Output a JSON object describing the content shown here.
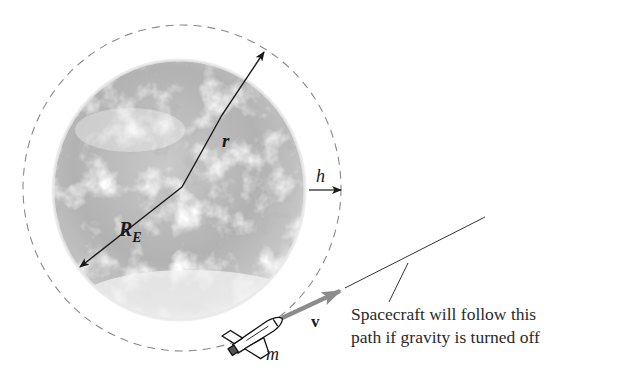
{
  "diagram": {
    "labels": {
      "orbit_radius": "r",
      "earth_radius_main": "R",
      "earth_radius_sub": "E",
      "altitude": "h",
      "velocity": "v",
      "mass": "m"
    },
    "caption": {
      "line1": "Spacecraft will follow this",
      "line2": "path if gravity is turned off"
    },
    "elements": {
      "earth": "Earth (grayscale photo)",
      "orbit": "dashed circular orbit",
      "spacecraft": "space shuttle",
      "trajectory": "straight tangent path"
    },
    "colors": {
      "background": "#ffffff",
      "earth_base": "#b5b5b5",
      "orbit_dash": "#8a8a8a",
      "arrow_black": "#1a1a1a",
      "velocity_arrow": "#8c8c8c"
    }
  }
}
